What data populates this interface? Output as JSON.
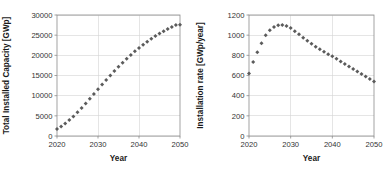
{
  "figure": {
    "background_color": "#ffffff",
    "marker_color": "#5b5b5b",
    "grid_color": "#d4d4d4",
    "frame_color": "#8c8c8c"
  },
  "chart_data": [
    {
      "type": "scatter",
      "title": "",
      "xlabel": "Year",
      "ylabel": "Total Installed Capacity [GWp]",
      "xlim": [
        2020,
        2050
      ],
      "ylim": [
        0,
        30000
      ],
      "xticks": [
        2020,
        2030,
        2040,
        2050
      ],
      "yticks": [
        0,
        5000,
        10000,
        15000,
        20000,
        25000,
        30000
      ],
      "xtick_labels": [
        "2020",
        "2030",
        "2040",
        "2050"
      ],
      "ytick_labels": [
        "0",
        "5000",
        "10000",
        "15000",
        "20000",
        "25000",
        "30000"
      ],
      "grid": true,
      "grid_axes": "both",
      "legend": false,
      "marker": "diamond",
      "x": [
        2020,
        2021,
        2022,
        2023,
        2024,
        2025,
        2026,
        2027,
        2028,
        2029,
        2030,
        2031,
        2032,
        2033,
        2034,
        2035,
        2036,
        2037,
        2038,
        2039,
        2040,
        2041,
        2042,
        2043,
        2044,
        2045,
        2046,
        2047,
        2048,
        2049,
        2050
      ],
      "y": [
        1750,
        2370,
        3105,
        3940,
        4865,
        5870,
        6940,
        8060,
        9215,
        10390,
        11570,
        12740,
        13890,
        15015,
        16110,
        17170,
        18190,
        19170,
        20105,
        20995,
        21840,
        22640,
        23395,
        24105,
        24770,
        25395,
        25980,
        26525,
        27030,
        27500,
        27590
      ]
    },
    {
      "type": "scatter",
      "title": "",
      "xlabel": "Year",
      "ylabel": "Installation rate [GWp/year]",
      "xlim": [
        2020,
        2050
      ],
      "ylim": [
        0,
        1200
      ],
      "xticks": [
        2020,
        2030,
        2040,
        2050
      ],
      "yticks": [
        0,
        200,
        400,
        600,
        800,
        1000,
        1200
      ],
      "xtick_labels": [
        "2020",
        "2030",
        "2040",
        "2050"
      ],
      "ytick_labels": [
        "0",
        "200",
        "400",
        "600",
        "800",
        "1000",
        "1200"
      ],
      "grid": true,
      "grid_axes": "both",
      "legend": false,
      "marker": "diamond",
      "x": [
        2020,
        2021,
        2022,
        2023,
        2024,
        2025,
        2026,
        2027,
        2028,
        2029,
        2030,
        2031,
        2032,
        2033,
        2034,
        2035,
        2036,
        2037,
        2038,
        2039,
        2040,
        2041,
        2042,
        2043,
        2044,
        2045,
        2046,
        2047,
        2048,
        2049,
        2050
      ],
      "y": [
        620,
        735,
        830,
        920,
        1000,
        1050,
        1080,
        1098,
        1100,
        1090,
        1070,
        1040,
        1010,
        975,
        945,
        915,
        885,
        860,
        835,
        810,
        790,
        765,
        740,
        715,
        690,
        665,
        640,
        615,
        590,
        565,
        540
      ]
    }
  ]
}
